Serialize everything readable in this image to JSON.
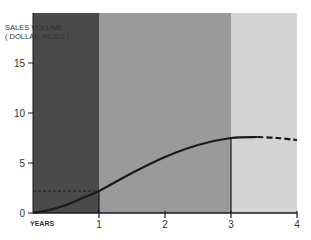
{
  "chart_data": {
    "type": "line",
    "title": "",
    "ylabel": "SALES VOLUME (DOLLAR INDEX)",
    "ylabel_lines": [
      "SALES VOLUME",
      "( DOLLAR INDEX )"
    ],
    "xlabel": "YEARS",
    "xlim": [
      0,
      4
    ],
    "ylim": [
      0,
      20
    ],
    "x_ticks": [
      "1",
      "2",
      "3",
      "4"
    ],
    "y_ticks": [
      "0",
      "5",
      "10",
      "15"
    ],
    "grid": false,
    "shaded_regions": [
      {
        "x_from": 0,
        "x_to": 1,
        "color": "#4a4a4a"
      },
      {
        "x_from": 1,
        "x_to": 3,
        "color": "#9a9a9a"
      },
      {
        "x_from": 3,
        "x_to": 4,
        "color": "#d4d4d4"
      }
    ],
    "series": [
      {
        "name": "Sales volume (solid)",
        "x": [
          0,
          0.25,
          0.5,
          0.75,
          1.0,
          1.5,
          2.0,
          2.5,
          3.0,
          3.4
        ],
        "values": [
          0,
          0.3,
          0.8,
          1.5,
          2.2,
          4.0,
          5.6,
          6.8,
          7.5,
          7.6
        ],
        "style": "solid"
      },
      {
        "name": "Sales volume (projected)",
        "x": [
          3.4,
          3.7,
          4.0
        ],
        "values": [
          7.6,
          7.5,
          7.3
        ],
        "style": "dashed"
      }
    ],
    "annotations": [
      {
        "type": "hline-dashed",
        "y": 2.2,
        "x_from": 0,
        "x_to": 1
      },
      {
        "type": "vline",
        "x": 3,
        "y_from": 0,
        "y_to": 7.5
      }
    ]
  }
}
